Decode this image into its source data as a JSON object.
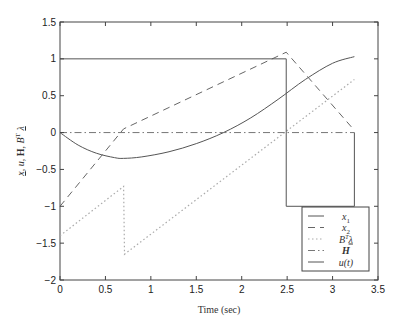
{
  "chart_data": {
    "type": "line",
    "title": "",
    "xlabel": "Time (sec)",
    "ylabel": "x, u, H, B^T λ",
    "xlim": [
      0,
      3.5
    ],
    "ylim": [
      -2,
      1.5
    ],
    "xticks": [
      0,
      0.5,
      1,
      1.5,
      2,
      2.5,
      3,
      3.5
    ],
    "xtick_labels": [
      "0",
      "0.5",
      "1",
      "1.5",
      "2",
      "2.5",
      "3",
      "3.5"
    ],
    "yticks": [
      -2,
      -1.5,
      -1,
      -0.5,
      0,
      0.5,
      1,
      1.5
    ],
    "ytick_labels": [
      "−2",
      "−1.5",
      "−1",
      "−0.5",
      "0",
      "0.5",
      "1",
      "1.5"
    ],
    "grid": false,
    "legend_position": "lower right",
    "series": [
      {
        "name": "x1",
        "label": "x₁",
        "style": "solid",
        "x": [
          0,
          0.2,
          0.4,
          0.6,
          0.7,
          0.9,
          1.2,
          1.5,
          1.8,
          2.1,
          2.4,
          2.7,
          3.0,
          3.24
        ],
        "y": [
          0,
          -0.17,
          -0.28,
          -0.34,
          -0.35,
          -0.33,
          -0.26,
          -0.15,
          0.0,
          0.2,
          0.45,
          0.72,
          0.94,
          1.03
        ]
      },
      {
        "name": "x2",
        "label": "x₂",
        "style": "dashed",
        "x": [
          0,
          0.7,
          2.49,
          3.24
        ],
        "y": [
          -1,
          0.05,
          1.09,
          0.03
        ]
      },
      {
        "name": "BTlambda",
        "label": "Bᵀλ",
        "style": "dotted",
        "x": [
          0,
          0.7,
          0.71,
          3.24
        ],
        "y": [
          -1.4,
          -0.73,
          -1.65,
          0.72
        ]
      },
      {
        "name": "H",
        "label": "H",
        "style": "dashdot",
        "x": [
          0,
          3.24
        ],
        "y": [
          0,
          0
        ]
      },
      {
        "name": "u",
        "label": "u(t)",
        "style": "solid",
        "x": [
          0,
          2.49,
          2.49,
          3.24,
          3.24
        ],
        "y": [
          1,
          1,
          -1,
          -1,
          0
        ]
      }
    ]
  },
  "legend": {
    "items": [
      {
        "label": "x",
        "sub": "1",
        "style": "solid"
      },
      {
        "label": "x",
        "sub": "2",
        "style": "dashed"
      },
      {
        "label": "BTλ",
        "sub": "",
        "style": "dotted"
      },
      {
        "label": "H",
        "sub": "",
        "style": "dashdot"
      },
      {
        "label": "u(t)",
        "sub": "",
        "style": "solid"
      }
    ]
  }
}
